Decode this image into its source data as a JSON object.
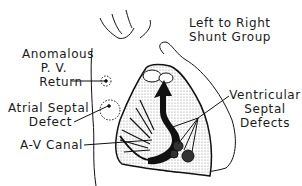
{
  "title": {
    "line1": "Left to Right",
    "line2": "Shunt Group"
  },
  "labels": {
    "anomalous_pv_return": {
      "line1": "Anomalous",
      "line2": "P. V.",
      "line3": "Return"
    },
    "atrial_septal_defect": {
      "line1": "Atrial Septal",
      "line2": "Defect"
    },
    "av_canal": {
      "line1": "A-V Canal"
    },
    "ventricular_septal_defects": {
      "line1": "Ventricular",
      "line2": "Septal",
      "line3": "Defects"
    }
  },
  "colors": {
    "ink": "#111111",
    "stipple": "#bdbdbd",
    "background": "#ffffff"
  }
}
